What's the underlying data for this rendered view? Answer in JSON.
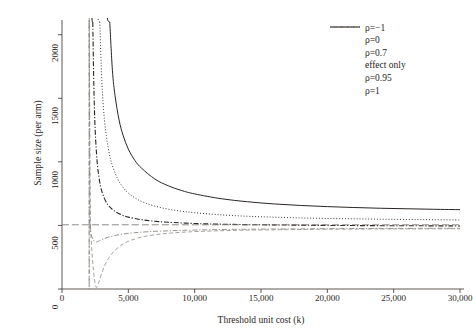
{
  "chart_data": {
    "type": "line",
    "title": "",
    "xlabel": "Threshold unit cost (k)",
    "ylabel": "Sample size (per arm)",
    "xlim": [
      0,
      30000
    ],
    "ylim": [
      0,
      2100
    ],
    "xticks": [
      0,
      5000,
      10000,
      15000,
      20000,
      25000,
      30000
    ],
    "xticklabels": [
      "0",
      "5,000",
      "10,000",
      "15,000",
      "20,000",
      "25,000",
      "30,000"
    ],
    "yticks": [
      0,
      500,
      1000,
      1500,
      2000
    ],
    "yticklabels": [
      "0",
      "500",
      "1000",
      "1500",
      "2000"
    ],
    "grid": false,
    "legend_position": "top-right",
    "line_color": "#2a2522",
    "series": [
      {
        "name": "ρ=−1",
        "style": "solid",
        "asymptote_x": 3400,
        "points": [
          [
            3600,
            2100
          ],
          [
            3800,
            1720
          ],
          [
            4000,
            1520
          ],
          [
            4300,
            1330
          ],
          [
            4600,
            1210
          ],
          [
            5000,
            1100
          ],
          [
            5500,
            1010
          ],
          [
            6000,
            950
          ],
          [
            7000,
            865
          ],
          [
            8000,
            812
          ],
          [
            9000,
            775
          ],
          [
            10000,
            748
          ],
          [
            12000,
            710
          ],
          [
            14000,
            686
          ],
          [
            16000,
            669
          ],
          [
            18000,
            657
          ],
          [
            20000,
            648
          ],
          [
            22000,
            641
          ],
          [
            24000,
            635
          ],
          [
            26000,
            631
          ],
          [
            28000,
            627
          ],
          [
            30000,
            624
          ]
        ]
      },
      {
        "name": "ρ=0",
        "style": "dotted",
        "asymptote_x": 2700,
        "points": [
          [
            2850,
            2100
          ],
          [
            3000,
            1640
          ],
          [
            3200,
            1330
          ],
          [
            3500,
            1100
          ],
          [
            3800,
            970
          ],
          [
            4200,
            865
          ],
          [
            4600,
            800
          ],
          [
            5000,
            755
          ],
          [
            5600,
            710
          ],
          [
            6200,
            680
          ],
          [
            7000,
            652
          ],
          [
            8000,
            628
          ],
          [
            9000,
            612
          ],
          [
            10000,
            600
          ],
          [
            12000,
            583
          ],
          [
            14000,
            572
          ],
          [
            16000,
            565
          ],
          [
            18000,
            559
          ],
          [
            20000,
            555
          ],
          [
            22000,
            552
          ],
          [
            24000,
            549
          ],
          [
            26000,
            547
          ],
          [
            28000,
            545
          ],
          [
            30000,
            543
          ]
        ]
      },
      {
        "name": "ρ=0.7",
        "style": "dashdot",
        "asymptote_x": 2250,
        "points": [
          [
            2320,
            2100
          ],
          [
            2400,
            1600
          ],
          [
            2500,
            1250
          ],
          [
            2650,
            1000
          ],
          [
            2800,
            870
          ],
          [
            3000,
            770
          ],
          [
            3300,
            690
          ],
          [
            3600,
            645
          ],
          [
            4000,
            610
          ],
          [
            4500,
            582
          ],
          [
            5000,
            565
          ],
          [
            6000,
            545
          ],
          [
            7000,
            533
          ],
          [
            8000,
            525
          ],
          [
            10000,
            515
          ],
          [
            12000,
            510
          ],
          [
            14000,
            506
          ],
          [
            16000,
            504
          ],
          [
            18000,
            502
          ],
          [
            20000,
            500
          ],
          [
            24000,
            498
          ],
          [
            27000,
            497
          ],
          [
            30000,
            496
          ]
        ]
      },
      {
        "name": "effect only",
        "style": "longdash",
        "constant_value": 505,
        "points": [
          [
            0,
            505
          ],
          [
            30000,
            505
          ]
        ]
      },
      {
        "name": "ρ=0.95",
        "style": "dashdot-light",
        "asymptote_x": 2050,
        "minimum": [
          2550,
          370
        ],
        "points": [
          [
            2100,
            510
          ],
          [
            2200,
            430
          ],
          [
            2350,
            388
          ],
          [
            2550,
            370
          ],
          [
            2800,
            378
          ],
          [
            3100,
            393
          ],
          [
            3500,
            408
          ],
          [
            4000,
            421
          ],
          [
            4600,
            432
          ],
          [
            5400,
            442
          ],
          [
            6400,
            450
          ],
          [
            7600,
            456
          ],
          [
            9000,
            461
          ],
          [
            11000,
            466
          ],
          [
            13000,
            469
          ],
          [
            15000,
            471
          ],
          [
            18000,
            473
          ],
          [
            21000,
            475
          ],
          [
            24000,
            476
          ],
          [
            27000,
            477
          ],
          [
            30000,
            478
          ]
        ]
      },
      {
        "name": "ρ=1",
        "style": "dashed-light",
        "asymptote_x": 2050,
        "minimum": [
          2600,
          12
        ],
        "points": [
          [
            2150,
            480
          ],
          [
            2250,
            300
          ],
          [
            2380,
            140
          ],
          [
            2500,
            40
          ],
          [
            2600,
            12
          ],
          [
            2750,
            45
          ],
          [
            2950,
            110
          ],
          [
            3200,
            180
          ],
          [
            3500,
            240
          ],
          [
            3900,
            295
          ],
          [
            4400,
            340
          ],
          [
            5000,
            375
          ],
          [
            5800,
            403
          ],
          [
            6800,
            424
          ],
          [
            8000,
            438
          ],
          [
            9500,
            449
          ],
          [
            11500,
            457
          ],
          [
            14000,
            463
          ],
          [
            17000,
            467
          ],
          [
            20000,
            470
          ],
          [
            24000,
            472
          ],
          [
            27000,
            473
          ],
          [
            30000,
            474
          ]
        ]
      }
    ]
  },
  "legend": {
    "items": [
      {
        "label": "ρ=−1",
        "key": "solid"
      },
      {
        "label": "ρ=0",
        "key": "dotted"
      },
      {
        "label": "ρ=0.7",
        "key": "dashdot"
      },
      {
        "label": "effect only",
        "key": "longdash"
      },
      {
        "label": "ρ=0.95",
        "key": "dashdot-light"
      },
      {
        "label": "ρ=1",
        "key": "dashed-light"
      }
    ]
  }
}
